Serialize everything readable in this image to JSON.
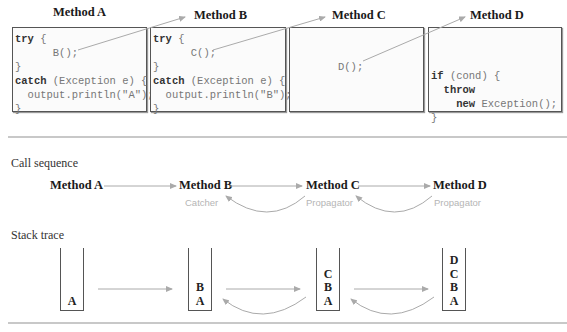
{
  "methods": [
    {
      "name": "Method A",
      "code": [
        "try {",
        "      B();",
        "}",
        "catch (Exception e) {",
        "  output.println(\"A\");",
        "}"
      ]
    },
    {
      "name": "Method B",
      "code": [
        "try {",
        "      C();",
        "}",
        "catch (Exception e) {",
        "  output.println(\"B\");",
        "}"
      ]
    },
    {
      "name": "Method C",
      "code": [
        "D();"
      ]
    },
    {
      "name": "Method D",
      "code": [
        "if (cond) {",
        "  throw",
        "    new Exception();",
        "}"
      ]
    }
  ],
  "call_sequence": {
    "label": "Call sequence",
    "nodes": [
      {
        "name": "Method A",
        "role": ""
      },
      {
        "name": "Method B",
        "role": "Catcher"
      },
      {
        "name": "Method C",
        "role": "Propagator"
      },
      {
        "name": "Method D",
        "role": "Propagator"
      }
    ]
  },
  "stack_trace": {
    "label": "Stack trace",
    "stacks": [
      [
        "A"
      ],
      [
        "B",
        "A"
      ],
      [
        "C",
        "B",
        "A"
      ],
      [
        "D",
        "C",
        "B",
        "A"
      ]
    ]
  },
  "colors": {
    "arrow": "#aaaaaa",
    "role_text": "#b5b5b5",
    "rule": "#c8c8c8",
    "box_border": "#555555"
  }
}
